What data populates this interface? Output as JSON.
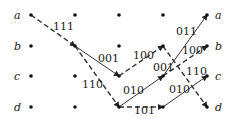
{
  "diagram": {
    "type": "trellis",
    "states": [
      "a",
      "b",
      "c",
      "d"
    ],
    "columns": 5,
    "left_labels": [
      "a",
      "b",
      "c",
      "d"
    ],
    "right_labels": [
      "a",
      "b",
      "c",
      "d"
    ],
    "edges": [
      {
        "from": {
          "col": 0,
          "state": "a"
        },
        "to": {
          "col": 1,
          "state": "b"
        },
        "style": "dashed",
        "label": "111"
      },
      {
        "from": {
          "col": 1,
          "state": "b"
        },
        "to": {
          "col": 2,
          "state": "c"
        },
        "style": "solid",
        "label": "001"
      },
      {
        "from": {
          "col": 1,
          "state": "b"
        },
        "to": {
          "col": 2,
          "state": "d"
        },
        "style": "dashed",
        "label": "110"
      },
      {
        "from": {
          "col": 2,
          "state": "c"
        },
        "to": {
          "col": 3,
          "state": "b"
        },
        "style": "dashed",
        "label": "100"
      },
      {
        "from": {
          "col": 2,
          "state": "d"
        },
        "to": {
          "col": 3,
          "state": "c"
        },
        "style": "solid",
        "label": "010"
      },
      {
        "from": {
          "col": 2,
          "state": "d"
        },
        "to": {
          "col": 3,
          "state": "d"
        },
        "style": "dashed",
        "label": "101"
      },
      {
        "from": {
          "col": 3,
          "state": "b"
        },
        "to": {
          "col": 4,
          "state": "d"
        },
        "style": "dashed",
        "label": "110"
      },
      {
        "from": {
          "col": 3,
          "state": "c"
        },
        "to": {
          "col": 4,
          "state": "a"
        },
        "style": "solid",
        "label": "011"
      },
      {
        "from": {
          "col": 3,
          "state": "c"
        },
        "to": {
          "col": 4,
          "state": "b"
        },
        "style": "dashed",
        "label": "001"
      },
      {
        "from": {
          "col": 3,
          "state": "d"
        },
        "to": {
          "col": 4,
          "state": "c"
        },
        "style": "solid",
        "label": "010"
      }
    ]
  }
}
